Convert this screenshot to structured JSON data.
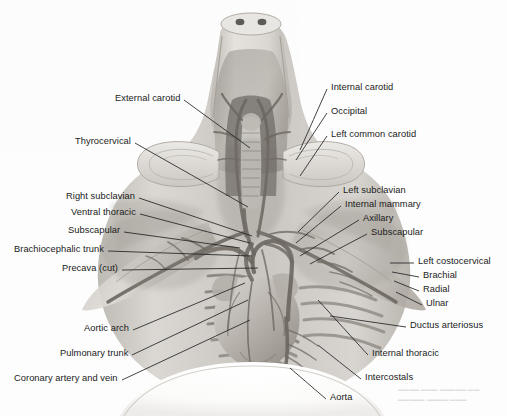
{
  "figure": {
    "style": {
      "background": "#fdfdfd",
      "ink": "#1b1b1b",
      "leader_color": "#242424",
      "tissue_light": "#e8e6e2",
      "tissue_mid": "#c9c5bf",
      "tissue_dark": "#9b968f",
      "vessel_dark": "#6f6a64"
    },
    "ghost_text": "faint show-through text from reverse of page"
  },
  "labels_left": [
    {
      "id": "external-carotid",
      "text": "External carotid",
      "x": 115,
      "y": 100,
      "tip_x": 250,
      "tip_y": 148
    },
    {
      "id": "thyrocervical",
      "text": "Thyrocervical",
      "x": 75,
      "y": 143,
      "tip_x": 248,
      "tip_y": 207
    },
    {
      "id": "right-subclavian",
      "text": "Right subclavian",
      "x": 66,
      "y": 198,
      "tip_x": 252,
      "tip_y": 236
    },
    {
      "id": "ventral-thoracic",
      "text": "Ventral thoracic",
      "x": 71,
      "y": 214,
      "tip_x": 250,
      "tip_y": 243
    },
    {
      "id": "subscapular-left",
      "text": "Subscapular",
      "x": 68,
      "y": 232,
      "tip_x": 240,
      "tip_y": 248
    },
    {
      "id": "brachiocephalic-trunk",
      "text": "Brachiocephalic trunk",
      "x": 14,
      "y": 251,
      "tip_x": 252,
      "tip_y": 256
    },
    {
      "id": "precava-cut",
      "text": "Precava (cut)",
      "x": 62,
      "y": 270,
      "tip_x": 258,
      "tip_y": 268
    },
    {
      "id": "aortic-arch",
      "text": "Aortic arch",
      "x": 84,
      "y": 330,
      "tip_x": 245,
      "tip_y": 283
    },
    {
      "id": "pulmonary-trunk",
      "text": "Pulmonary trunk",
      "x": 60,
      "y": 355,
      "tip_x": 248,
      "tip_y": 300
    },
    {
      "id": "coronary-artery-vein",
      "text": "Coronary artery and vein",
      "x": 14,
      "y": 380,
      "tip_x": 250,
      "tip_y": 320
    }
  ],
  "labels_right": [
    {
      "id": "internal-carotid",
      "text": "Internal carotid",
      "x": 331,
      "y": 89,
      "tip_x": 300,
      "tip_y": 150
    },
    {
      "id": "occipital",
      "text": "Occipital",
      "x": 331,
      "y": 113,
      "tip_x": 296,
      "tip_y": 160
    },
    {
      "id": "left-common-carotid",
      "text": "Left common carotid",
      "x": 331,
      "y": 136,
      "tip_x": 300,
      "tip_y": 176
    },
    {
      "id": "left-subclavian",
      "text": "Left subclavian",
      "x": 343,
      "y": 192,
      "tip_x": 298,
      "tip_y": 232
    },
    {
      "id": "internal-mammary",
      "text": "Internal mammary",
      "x": 345,
      "y": 206,
      "tip_x": 296,
      "tip_y": 243
    },
    {
      "id": "axillary",
      "text": "Axillary",
      "x": 363,
      "y": 220,
      "tip_x": 300,
      "tip_y": 256
    },
    {
      "id": "subscapular-right",
      "text": "Subscapular",
      "x": 371,
      "y": 234,
      "tip_x": 310,
      "tip_y": 264
    },
    {
      "id": "left-costocervical",
      "text": "Left costocervical",
      "x": 418,
      "y": 263,
      "tip_x": 390,
      "tip_y": 263
    },
    {
      "id": "brachial",
      "text": "Brachial",
      "x": 423,
      "y": 277,
      "tip_x": 392,
      "tip_y": 272
    },
    {
      "id": "radial",
      "text": "Radial",
      "x": 423,
      "y": 291,
      "tip_x": 394,
      "tip_y": 281
    },
    {
      "id": "ulnar",
      "text": "Ulnar",
      "x": 426,
      "y": 305,
      "tip_x": 396,
      "tip_y": 292
    },
    {
      "id": "ductus-arteriosus",
      "text": "Ductus arteriosus",
      "x": 410,
      "y": 327,
      "tip_x": 330,
      "tip_y": 316
    },
    {
      "id": "internal-thoracic",
      "text": "Internal thoracic",
      "x": 372,
      "y": 355,
      "tip_x": 318,
      "tip_y": 300
    },
    {
      "id": "intercostals",
      "text": "Intercostals",
      "x": 365,
      "y": 379,
      "tip_x": 318,
      "tip_y": 345
    },
    {
      "id": "aorta",
      "text": "Aorta",
      "x": 330,
      "y": 399,
      "tip_x": 290,
      "tip_y": 368
    }
  ]
}
